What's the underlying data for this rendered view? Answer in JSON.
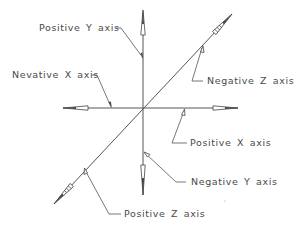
{
  "diagram": {
    "labels": {
      "positive_y": "Positive Y axis",
      "negative_x": "Nevative X axis",
      "negative_z": "Negative Z axis",
      "positive_x": "Positive X axis",
      "negative_y": "Negative Y axis",
      "positive_z": "Positive Z axis"
    },
    "colors": {
      "line": "#555555",
      "text": "#4a4a4a",
      "background": "#ffffff"
    }
  }
}
